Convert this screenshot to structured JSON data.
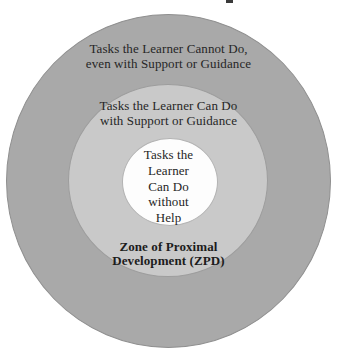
{
  "diagram": {
    "outer_ring": {
      "text": "Tasks the Learner Cannot Do,\neven with Support or Guidance",
      "fill": "#a9a9a9"
    },
    "middle_ring": {
      "text": "Tasks the Learner Can Do\nwith Support or Guidance",
      "fill": "#c9c9c9"
    },
    "inner_circle": {
      "text": "Tasks the\nLearner\nCan Do\nwithout\nHelp",
      "fill": "#fdfdfd"
    },
    "zpd_label": {
      "text": "Zone of Proximal\nDevelopment (ZPD)"
    },
    "text_color": "#262626"
  }
}
